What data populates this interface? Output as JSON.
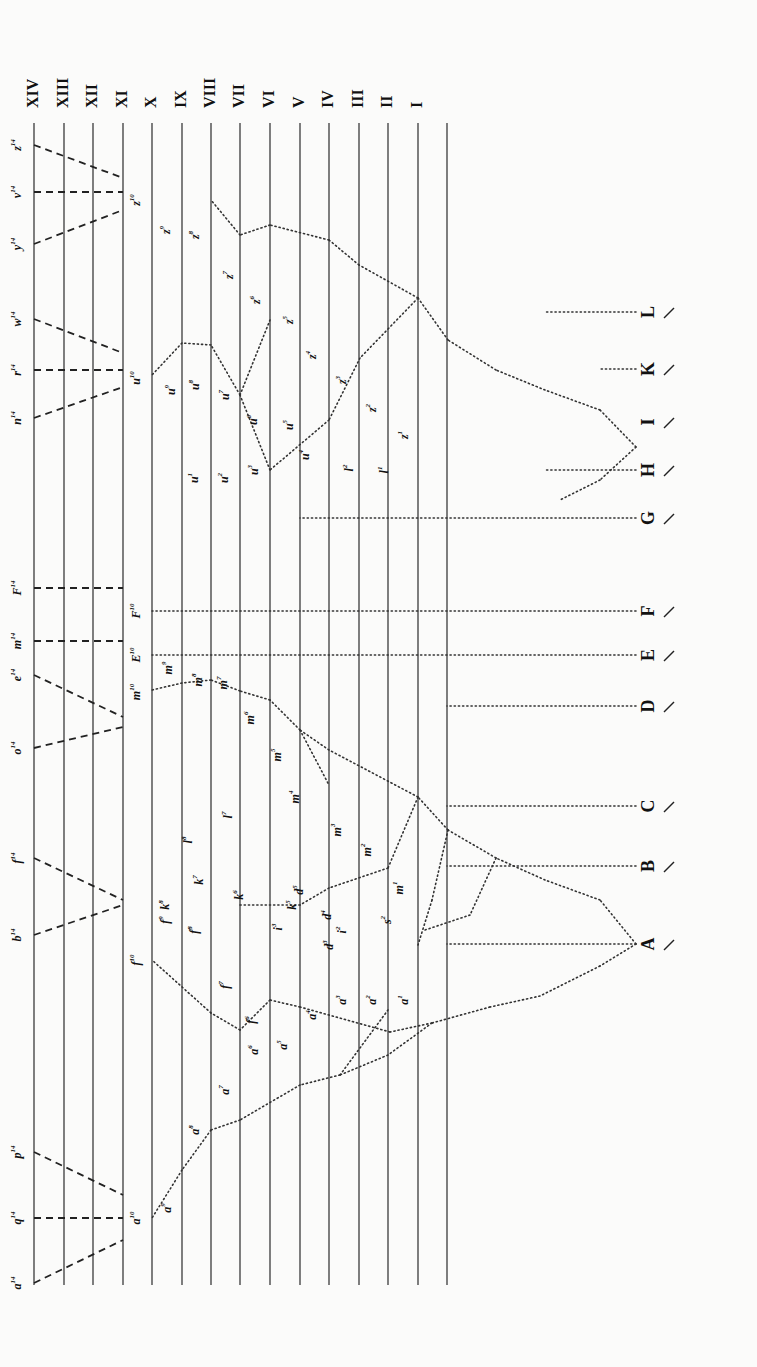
{
  "diagram": {
    "generations": {
      "labels": [
        "XIV",
        "XIII",
        "XII",
        "XI",
        "X",
        "IX",
        "VIII",
        "VII",
        "VI",
        "V",
        "IV",
        "III",
        "II",
        "I"
      ],
      "line_x": [
        34,
        64,
        93,
        123,
        152,
        182,
        211,
        240,
        270,
        300,
        329,
        359,
        388,
        418,
        447
      ],
      "line_top": 123,
      "line_bottom": 1285,
      "label_y": 108
    },
    "base_species": {
      "labels": [
        "A",
        "B",
        "C",
        "D",
        "E",
        "F",
        "G",
        "H",
        "I",
        "K",
        "L"
      ],
      "x": 650,
      "y": [
        944,
        866,
        806,
        706,
        655,
        611,
        518,
        470,
        422,
        369,
        312
      ]
    },
    "final_forms_gen14": [
      "a14",
      "q14",
      "p14",
      "b14",
      "f14",
      "o14",
      "e14",
      "m14",
      "F14",
      "n14",
      "r14",
      "w14",
      "y14",
      "v14",
      "z14"
    ],
    "gen10_forms": [
      "a10",
      "f10",
      "m10",
      "E10",
      "F10",
      "u10",
      "z10"
    ],
    "dashed_lines": [
      [
        [
          34,
          1283
        ],
        [
          123,
          1240
        ]
      ],
      [
        [
          34,
          1218
        ],
        [
          123,
          1218
        ]
      ],
      [
        [
          34,
          1152
        ],
        [
          123,
          1195
        ]
      ],
      [
        [
          34,
          935
        ],
        [
          123,
          905
        ]
      ],
      [
        [
          34,
          858
        ],
        [
          123,
          900
        ]
      ],
      [
        [
          34,
          748
        ],
        [
          123,
          727
        ]
      ],
      [
        [
          34,
          675
        ],
        [
          123,
          717
        ]
      ],
      [
        [
          34,
          641
        ],
        [
          123,
          641
        ]
      ],
      [
        [
          34,
          588
        ],
        [
          123,
          588
        ]
      ],
      [
        [
          34,
          418
        ],
        [
          123,
          387
        ]
      ],
      [
        [
          34,
          370
        ],
        [
          123,
          370
        ]
      ],
      [
        [
          34,
          319
        ],
        [
          123,
          353
        ]
      ],
      [
        [
          34,
          244
        ],
        [
          123,
          210
        ]
      ],
      [
        [
          34,
          192
        ],
        [
          123,
          192
        ]
      ],
      [
        [
          34,
          145
        ],
        [
          123,
          178
        ]
      ]
    ],
    "dotted_lines": [
      [
        [
          636,
          944
        ],
        [
          447,
          944
        ]
      ],
      [
        [
          636,
          866
        ],
        [
          447,
          866
        ]
      ],
      [
        [
          636,
          806
        ],
        [
          447,
          806
        ]
      ],
      [
        [
          636,
          706
        ],
        [
          447,
          706
        ]
      ],
      [
        [
          636,
          655
        ],
        [
          152,
          655
        ]
      ],
      [
        [
          636,
          611
        ],
        [
          152,
          611
        ]
      ],
      [
        [
          636,
          518
        ],
        [
          300,
          518
        ]
      ],
      [
        [
          636,
          470
        ],
        [
          545,
          470
        ]
      ],
      [
        [
          636,
          369
        ],
        [
          600,
          369
        ]
      ],
      [
        [
          636,
          312
        ],
        [
          545,
          312
        ]
      ],
      [
        [
          636,
          944
        ],
        [
          600,
          966
        ]
      ],
      [
        [
          600,
          966
        ],
        [
          540,
          996
        ]
      ],
      [
        [
          540,
          996
        ],
        [
          490,
          1007
        ]
      ],
      [
        [
          490,
          1007
        ],
        [
          432,
          1023
        ]
      ],
      [
        [
          432,
          1023
        ],
        [
          388,
          1055
        ]
      ],
      [
        [
          388,
          1055
        ],
        [
          340,
          1075
        ]
      ],
      [
        [
          340,
          1075
        ],
        [
          300,
          1085
        ]
      ],
      [
        [
          300,
          1085
        ],
        [
          240,
          1120
        ]
      ],
      [
        [
          240,
          1120
        ],
        [
          211,
          1130
        ]
      ],
      [
        [
          211,
          1130
        ],
        [
          182,
          1170
        ]
      ],
      [
        [
          182,
          1170
        ],
        [
          152,
          1218
        ]
      ],
      [
        [
          432,
          1023
        ],
        [
          390,
          1032
        ]
      ],
      [
        [
          390,
          1032
        ],
        [
          300,
          1007
        ]
      ],
      [
        [
          300,
          1007
        ],
        [
          270,
          1000
        ]
      ],
      [
        [
          340,
          1075
        ],
        [
          388,
          1010
        ]
      ],
      [
        [
          270,
          1000
        ],
        [
          240,
          1030
        ]
      ],
      [
        [
          240,
          1030
        ],
        [
          211,
          1013
        ]
      ],
      [
        [
          211,
          1013
        ],
        [
          152,
          960
        ]
      ],
      [
        [
          636,
          944
        ],
        [
          600,
          900
        ]
      ],
      [
        [
          600,
          900
        ],
        [
          545,
          880
        ]
      ],
      [
        [
          545,
          880
        ],
        [
          496,
          858
        ]
      ],
      [
        [
          496,
          858
        ],
        [
          448,
          830
        ]
      ],
      [
        [
          448,
          830
        ],
        [
          418,
          797
        ]
      ],
      [
        [
          418,
          797
        ],
        [
          329,
          750
        ]
      ],
      [
        [
          329,
          750
        ],
        [
          300,
          730
        ]
      ],
      [
        [
          300,
          730
        ],
        [
          270,
          700
        ]
      ],
      [
        [
          270,
          700
        ],
        [
          240,
          691
        ]
      ],
      [
        [
          240,
          691
        ],
        [
          211,
          680
        ]
      ],
      [
        [
          211,
          680
        ],
        [
          182,
          683
        ]
      ],
      [
        [
          182,
          683
        ],
        [
          152,
          690
        ]
      ],
      [
        [
          300,
          730
        ],
        [
          329,
          785
        ]
      ],
      [
        [
          496,
          858
        ],
        [
          470,
          915
        ]
      ],
      [
        [
          470,
          915
        ],
        [
          425,
          930
        ]
      ],
      [
        [
          448,
          830
        ],
        [
          432,
          900
        ]
      ],
      [
        [
          432,
          900
        ],
        [
          418,
          945
        ]
      ],
      [
        [
          418,
          797
        ],
        [
          388,
          868
        ]
      ],
      [
        [
          388,
          868
        ],
        [
          329,
          888
        ]
      ],
      [
        [
          329,
          888
        ],
        [
          300,
          905
        ]
      ],
      [
        [
          300,
          905
        ],
        [
          240,
          905
        ]
      ],
      [
        [
          636,
          447
        ],
        [
          600,
          410
        ]
      ],
      [
        [
          600,
          410
        ],
        [
          545,
          390
        ]
      ],
      [
        [
          545,
          390
        ],
        [
          496,
          370
        ]
      ],
      [
        [
          496,
          370
        ],
        [
          448,
          340
        ]
      ],
      [
        [
          448,
          340
        ],
        [
          418,
          298
        ]
      ],
      [
        [
          418,
          298
        ],
        [
          359,
          265
        ]
      ],
      [
        [
          359,
          265
        ],
        [
          329,
          240
        ]
      ],
      [
        [
          329,
          240
        ],
        [
          270,
          225
        ]
      ],
      [
        [
          270,
          225
        ],
        [
          240,
          235
        ]
      ],
      [
        [
          240,
          235
        ],
        [
          211,
          200
        ]
      ],
      [
        [
          636,
          447
        ],
        [
          600,
          480
        ]
      ],
      [
        [
          600,
          480
        ],
        [
          560,
          500
        ]
      ],
      [
        [
          418,
          298
        ],
        [
          360,
          358
        ]
      ],
      [
        [
          360,
          358
        ],
        [
          329,
          420
        ]
      ],
      [
        [
          329,
          420
        ],
        [
          270,
          470
        ]
      ],
      [
        [
          270,
          470
        ],
        [
          240,
          395
        ]
      ],
      [
        [
          240,
          395
        ],
        [
          211,
          345
        ]
      ],
      [
        [
          211,
          345
        ],
        [
          182,
          343
        ]
      ],
      [
        [
          182,
          343
        ],
        [
          152,
          375
        ]
      ],
      [
        [
          240,
          395
        ],
        [
          270,
          320
        ]
      ]
    ],
    "node_labels": [
      {
        "t": "a",
        "s": "14",
        "x": 18,
        "y": 1283
      },
      {
        "t": "q",
        "s": "14",
        "x": 18,
        "y": 1218
      },
      {
        "t": "p",
        "s": "14",
        "x": 18,
        "y": 1152
      },
      {
        "t": "b",
        "s": "14",
        "x": 18,
        "y": 935
      },
      {
        "t": "f",
        "s": "14",
        "x": 18,
        "y": 858
      },
      {
        "t": "o",
        "s": "14",
        "x": 18,
        "y": 748
      },
      {
        "t": "e",
        "s": "14",
        "x": 18,
        "y": 675
      },
      {
        "t": "m",
        "s": "14",
        "x": 18,
        "y": 641
      },
      {
        "t": "F",
        "s": "14",
        "x": 18,
        "y": 588
      },
      {
        "t": "n",
        "s": "14",
        "x": 18,
        "y": 418
      },
      {
        "t": "r",
        "s": "14",
        "x": 18,
        "y": 370
      },
      {
        "t": "w",
        "s": "14",
        "x": 18,
        "y": 319
      },
      {
        "t": "y",
        "s": "14",
        "x": 18,
        "y": 244
      },
      {
        "t": "v",
        "s": "14",
        "x": 18,
        "y": 192
      },
      {
        "t": "z",
        "s": "14",
        "x": 18,
        "y": 145
      },
      {
        "t": "a",
        "s": "10",
        "x": 137,
        "y": 1218
      },
      {
        "t": "f",
        "s": "10",
        "x": 137,
        "y": 960
      },
      {
        "t": "m",
        "s": "10",
        "x": 137,
        "y": 692
      },
      {
        "t": "E",
        "s": "10",
        "x": 137,
        "y": 655
      },
      {
        "t": "F",
        "s": "10",
        "x": 137,
        "y": 611
      },
      {
        "t": "u",
        "s": "10",
        "x": 137,
        "y": 378
      },
      {
        "t": "z",
        "s": "10",
        "x": 137,
        "y": 200
      },
      {
        "t": "a",
        "s": "9",
        "x": 168,
        "y": 1208
      },
      {
        "t": "a",
        "s": "8",
        "x": 196,
        "y": 1130
      },
      {
        "t": "a",
        "s": "7",
        "x": 226,
        "y": 1090
      },
      {
        "t": "a",
        "s": "6",
        "x": 255,
        "y": 1050
      },
      {
        "t": "a",
        "s": "5",
        "x": 284,
        "y": 1045
      },
      {
        "t": "a",
        "s": "4",
        "x": 313,
        "y": 1015
      },
      {
        "t": "a",
        "s": "3",
        "x": 343,
        "y": 1000
      },
      {
        "t": "a",
        "s": "2",
        "x": 373,
        "y": 1000
      },
      {
        "t": "a",
        "s": "1",
        "x": 405,
        "y": 1000
      },
      {
        "t": "d",
        "s": "5",
        "x": 300,
        "y": 890
      },
      {
        "t": "d",
        "s": "4",
        "x": 328,
        "y": 915
      },
      {
        "t": "d",
        "s": "3",
        "x": 330,
        "y": 945
      },
      {
        "t": "f",
        "s": "9",
        "x": 166,
        "y": 920
      },
      {
        "t": "f",
        "s": "8",
        "x": 195,
        "y": 930
      },
      {
        "t": "f",
        "s": "7",
        "x": 226,
        "y": 985
      },
      {
        "t": "f",
        "s": "6",
        "x": 252,
        "y": 1020
      },
      {
        "t": "k",
        "s": "8",
        "x": 166,
        "y": 905
      },
      {
        "t": "k",
        "s": "7",
        "x": 200,
        "y": 880
      },
      {
        "t": "k",
        "s": "6",
        "x": 240,
        "y": 895
      },
      {
        "t": "k",
        "s": "5",
        "x": 293,
        "y": 905
      },
      {
        "t": "i",
        "s": "3",
        "x": 279,
        "y": 927
      },
      {
        "t": "i",
        "s": "2",
        "x": 343,
        "y": 930
      },
      {
        "t": "s",
        "s": "2",
        "x": 388,
        "y": 920
      },
      {
        "t": "m",
        "s": "9",
        "x": 169,
        "y": 668
      },
      {
        "t": "m",
        "s": "8",
        "x": 199,
        "y": 680
      },
      {
        "t": "m",
        "s": "7",
        "x": 224,
        "y": 683
      },
      {
        "t": "m",
        "s": "6",
        "x": 251,
        "y": 718
      },
      {
        "t": "m",
        "s": "5",
        "x": 278,
        "y": 755
      },
      {
        "t": "m",
        "s": "4",
        "x": 296,
        "y": 797
      },
      {
        "t": "m",
        "s": "3",
        "x": 338,
        "y": 830
      },
      {
        "t": "m",
        "s": "2",
        "x": 368,
        "y": 850
      },
      {
        "t": "m",
        "s": "1",
        "x": 400,
        "y": 888
      },
      {
        "t": "l",
        "s": "7",
        "x": 229,
        "y": 815
      },
      {
        "t": "l",
        "s": "8",
        "x": 189,
        "y": 840
      },
      {
        "t": "z",
        "s": "9",
        "x": 167,
        "y": 230
      },
      {
        "t": "z",
        "s": "8",
        "x": 196,
        "y": 235
      },
      {
        "t": "z",
        "s": "7",
        "x": 230,
        "y": 275
      },
      {
        "t": "z",
        "s": "6",
        "x": 257,
        "y": 300
      },
      {
        "t": "z",
        "s": "5",
        "x": 290,
        "y": 320
      },
      {
        "t": "z",
        "s": "4",
        "x": 313,
        "y": 355
      },
      {
        "t": "z",
        "s": "3",
        "x": 343,
        "y": 380
      },
      {
        "t": "z",
        "s": "2",
        "x": 373,
        "y": 408
      },
      {
        "t": "z",
        "s": "1",
        "x": 405,
        "y": 435
      },
      {
        "t": "u",
        "s": "9",
        "x": 172,
        "y": 390
      },
      {
        "t": "u",
        "s": "8",
        "x": 196,
        "y": 385
      },
      {
        "t": "u",
        "s": "7",
        "x": 226,
        "y": 395
      },
      {
        "t": "u",
        "s": "6",
        "x": 254,
        "y": 420
      },
      {
        "t": "u",
        "s": "5",
        "x": 290,
        "y": 425
      },
      {
        "t": "u",
        "s": "4",
        "x": 306,
        "y": 455
      },
      {
        "t": "u",
        "s": "3",
        "x": 255,
        "y": 470
      },
      {
        "t": "u",
        "s": "2",
        "x": 225,
        "y": 478
      },
      {
        "t": "u",
        "s": "1",
        "x": 195,
        "y": 478
      },
      {
        "t": "l",
        "s": "1",
        "x": 385,
        "y": 470
      },
      {
        "t": "l",
        "s": "2",
        "x": 350,
        "y": 468
      }
    ]
  }
}
